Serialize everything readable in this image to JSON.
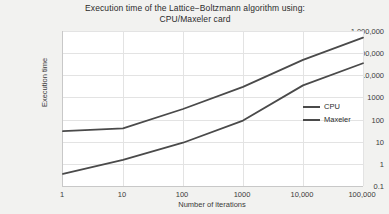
{
  "chart_data": {
    "type": "line",
    "title": "Execution time of the Lattice−Boltzmann algorithm using: CPU/Maxeler card",
    "title_line1": "Execution time of the Lattice−Boltzmann algorithm using:",
    "title_line2": "CPU/Maxeler card",
    "xlabel": "Number of iterations",
    "ylabel": "Execution time",
    "xscale": "log",
    "yscale": "log",
    "xlim": [
      1,
      100000
    ],
    "ylim": [
      0.1,
      1000000
    ],
    "grid": true,
    "legend_position": "right",
    "x": [
      1,
      10,
      100,
      1000,
      10000,
      100000
    ],
    "xtick_labels": [
      "1",
      "10",
      "100",
      "1000",
      "10,000",
      "100,000"
    ],
    "ytick_values": [
      1000000,
      100000,
      10000,
      1000,
      100,
      10,
      1,
      0.1
    ],
    "ytick_labels": [
      "1,000,000",
      "100,000",
      "10,000",
      "1000",
      "100",
      "10",
      "1",
      "0.1"
    ],
    "series": [
      {
        "name": "CPU",
        "color": "#4a4a4a",
        "values": [
          30,
          40,
          300,
          3000,
          50000,
          500000
        ]
      },
      {
        "name": "Maxeler",
        "color": "#4a4a4a",
        "values": [
          0.35,
          1.5,
          9,
          90,
          3500,
          35000
        ]
      }
    ]
  },
  "colors": {
    "background": "#f2f2f0",
    "plot_background": "#ffffff",
    "grid": "#e3e3e3",
    "axis": "#c8c8c8",
    "line": "#4a4a4a",
    "text": "#2b2b2b"
  }
}
